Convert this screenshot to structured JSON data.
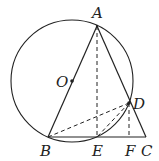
{
  "diagram": {
    "type": "geometry",
    "points": {
      "A": {
        "label": "A",
        "x": 97,
        "y": 26
      },
      "O": {
        "label": "O",
        "x": 72,
        "y": 81
      },
      "B": {
        "label": "B",
        "x": 48,
        "y": 137
      },
      "E": {
        "label": "E",
        "x": 97,
        "y": 137
      },
      "F": {
        "label": "F",
        "x": 130,
        "y": 137
      },
      "C": {
        "label": "C",
        "x": 146,
        "y": 137
      },
      "D": {
        "label": "D",
        "x": 129,
        "y": 103
      }
    },
    "circle": {
      "center": "O",
      "radius": 61
    },
    "solid_segments": [
      "AB",
      "AC",
      "BC"
    ],
    "dashed_segments": [
      "AE",
      "DF",
      "BD",
      "DE"
    ],
    "stroke_color": "#222222"
  }
}
